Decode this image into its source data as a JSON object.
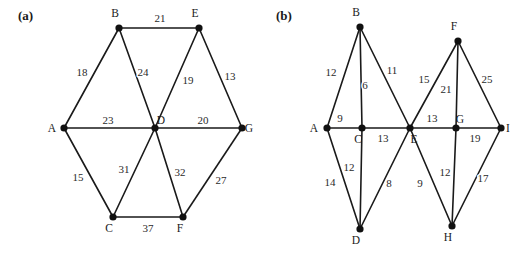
{
  "figure": {
    "title": "",
    "background_color": "#ffffff",
    "edge_color": "#1a1a1a",
    "node_color": "#111111",
    "text_color": "#1a1a1a"
  },
  "panels": [
    {
      "key": "a",
      "label": "(a)",
      "label_pos": {
        "x": 18,
        "y": 20
      },
      "nodes": [
        {
          "id": "A",
          "label": "A",
          "x": 64,
          "y": 128,
          "label_x": 52,
          "label_y": 132
        },
        {
          "id": "B",
          "label": "B",
          "x": 119,
          "y": 28,
          "label_x": 115,
          "label_y": 17
        },
        {
          "id": "C",
          "label": "C",
          "x": 113,
          "y": 217,
          "label_x": 109,
          "label_y": 232
        },
        {
          "id": "D",
          "label": "D",
          "x": 155,
          "y": 128,
          "label_x": 161,
          "label_y": 124
        },
        {
          "id": "E",
          "label": "E",
          "x": 199,
          "y": 28,
          "label_x": 195,
          "label_y": 17
        },
        {
          "id": "F",
          "label": "F",
          "x": 183,
          "y": 217,
          "label_x": 180,
          "label_y": 232
        },
        {
          "id": "G",
          "label": "G",
          "x": 242,
          "y": 128,
          "label_x": 249,
          "label_y": 132
        }
      ],
      "edges": [
        {
          "from": "B",
          "to": "E",
          "weight": 21,
          "label_x": 160,
          "label_y": 22
        },
        {
          "from": "A",
          "to": "B",
          "weight": 18,
          "label_x": 82,
          "label_y": 76
        },
        {
          "from": "B",
          "to": "D",
          "weight": 24,
          "label_x": 143,
          "label_y": 76
        },
        {
          "from": "D",
          "to": "E",
          "weight": 19,
          "label_x": 188,
          "label_y": 84
        },
        {
          "from": "E",
          "to": "G",
          "weight": 13,
          "label_x": 230,
          "label_y": 80
        },
        {
          "from": "A",
          "to": "D",
          "weight": 23,
          "label_x": 108,
          "label_y": 124
        },
        {
          "from": "D",
          "to": "G",
          "weight": 20,
          "label_x": 203,
          "label_y": 124
        },
        {
          "from": "A",
          "to": "C",
          "weight": 15,
          "label_x": 78,
          "label_y": 181
        },
        {
          "from": "C",
          "to": "D",
          "weight": 31,
          "label_x": 124,
          "label_y": 173
        },
        {
          "from": "D",
          "to": "F",
          "weight": 32,
          "label_x": 180,
          "label_y": 176
        },
        {
          "from": "F",
          "to": "G",
          "weight": 27,
          "label_x": 221,
          "label_y": 184
        },
        {
          "from": "C",
          "to": "F",
          "weight": 37,
          "label_x": 148,
          "label_y": 232
        }
      ]
    },
    {
      "key": "b",
      "label": "(b)",
      "label_pos": {
        "x": 276,
        "y": 20
      },
      "nodes": [
        {
          "id": "A",
          "label": "A",
          "x": 327,
          "y": 128,
          "label_x": 314,
          "label_y": 132
        },
        {
          "id": "B",
          "label": "B",
          "x": 360,
          "y": 27,
          "label_x": 356,
          "label_y": 16
        },
        {
          "id": "C",
          "label": "C",
          "x": 362,
          "y": 128,
          "label_x": 358,
          "label_y": 143
        },
        {
          "id": "D",
          "label": "D",
          "x": 360,
          "y": 229,
          "label_x": 356,
          "label_y": 244
        },
        {
          "id": "E",
          "label": "E",
          "x": 410,
          "y": 128,
          "label_x": 414,
          "label_y": 143
        },
        {
          "id": "F",
          "label": "F",
          "x": 458,
          "y": 41,
          "label_x": 454,
          "label_y": 30
        },
        {
          "id": "G",
          "label": "G",
          "x": 456,
          "y": 128,
          "label_x": 460,
          "label_y": 123
        },
        {
          "id": "H",
          "label": "H",
          "x": 452,
          "y": 226,
          "label_x": 448,
          "label_y": 241
        },
        {
          "id": "I",
          "label": "I",
          "x": 501,
          "y": 128,
          "label_x": 508,
          "label_y": 132
        }
      ],
      "edges": [
        {
          "from": "A",
          "to": "B",
          "weight": 12,
          "label_x": 331,
          "label_y": 76
        },
        {
          "from": "B",
          "to": "C",
          "weight": 6,
          "label_x": 365,
          "label_y": 89
        },
        {
          "from": "B",
          "to": "E",
          "weight": 11,
          "label_x": 392,
          "label_y": 74
        },
        {
          "from": "A",
          "to": "C",
          "weight": 9,
          "label_x": 340,
          "label_y": 122
        },
        {
          "from": "C",
          "to": "E",
          "weight": 13,
          "label_x": 383,
          "label_y": 142
        },
        {
          "from": "A",
          "to": "D",
          "weight": 14,
          "label_x": 330,
          "label_y": 186
        },
        {
          "from": "C",
          "to": "D",
          "weight": 12,
          "label_x": 349,
          "label_y": 171
        },
        {
          "from": "D",
          "to": "E",
          "weight": 8,
          "label_x": 389,
          "label_y": 187
        },
        {
          "from": "E",
          "to": "F",
          "weight": 15,
          "label_x": 424,
          "label_y": 83
        },
        {
          "from": "F",
          "to": "G",
          "weight": 21,
          "label_x": 446,
          "label_y": 93
        },
        {
          "from": "F",
          "to": "I",
          "weight": 25,
          "label_x": 487,
          "label_y": 83
        },
        {
          "from": "E",
          "to": "G",
          "weight": 13,
          "label_x": 432,
          "label_y": 122
        },
        {
          "from": "G",
          "to": "I",
          "weight": 19,
          "label_x": 475,
          "label_y": 142
        },
        {
          "from": "E",
          "to": "H",
          "weight": 9,
          "label_x": 420,
          "label_y": 187
        },
        {
          "from": "G",
          "to": "H",
          "weight": 12,
          "label_x": 445,
          "label_y": 176
        },
        {
          "from": "H",
          "to": "I",
          "weight": 17,
          "label_x": 483,
          "label_y": 182
        }
      ]
    }
  ],
  "chart_data": {
    "type": "diagram",
    "diagram_type": "weighted-undirected-graph",
    "title": "",
    "graphs": [
      {
        "name": "(a)",
        "vertices": [
          "A",
          "B",
          "C",
          "D",
          "E",
          "F",
          "G"
        ],
        "edges": [
          {
            "u": "B",
            "v": "E",
            "w": 21
          },
          {
            "u": "A",
            "v": "B",
            "w": 18
          },
          {
            "u": "B",
            "v": "D",
            "w": 24
          },
          {
            "u": "D",
            "v": "E",
            "w": 19
          },
          {
            "u": "E",
            "v": "G",
            "w": 13
          },
          {
            "u": "A",
            "v": "D",
            "w": 23
          },
          {
            "u": "D",
            "v": "G",
            "w": 20
          },
          {
            "u": "A",
            "v": "C",
            "w": 15
          },
          {
            "u": "C",
            "v": "D",
            "w": 31
          },
          {
            "u": "D",
            "v": "F",
            "w": 32
          },
          {
            "u": "F",
            "v": "G",
            "w": 27
          },
          {
            "u": "C",
            "v": "F",
            "w": 37
          }
        ]
      },
      {
        "name": "(b)",
        "vertices": [
          "A",
          "B",
          "C",
          "D",
          "E",
          "F",
          "G",
          "H",
          "I"
        ],
        "edges": [
          {
            "u": "A",
            "v": "B",
            "w": 12
          },
          {
            "u": "B",
            "v": "C",
            "w": 6
          },
          {
            "u": "B",
            "v": "E",
            "w": 11
          },
          {
            "u": "A",
            "v": "C",
            "w": 9
          },
          {
            "u": "C",
            "v": "E",
            "w": 13
          },
          {
            "u": "A",
            "v": "D",
            "w": 14
          },
          {
            "u": "C",
            "v": "D",
            "w": 12
          },
          {
            "u": "D",
            "v": "E",
            "w": 8
          },
          {
            "u": "E",
            "v": "F",
            "w": 15
          },
          {
            "u": "F",
            "v": "G",
            "w": 21
          },
          {
            "u": "F",
            "v": "I",
            "w": 25
          },
          {
            "u": "E",
            "v": "G",
            "w": 13
          },
          {
            "u": "G",
            "v": "I",
            "w": 19
          },
          {
            "u": "E",
            "v": "H",
            "w": 9
          },
          {
            "u": "G",
            "v": "H",
            "w": 12
          },
          {
            "u": "H",
            "v": "I",
            "w": 17
          }
        ]
      }
    ]
  }
}
